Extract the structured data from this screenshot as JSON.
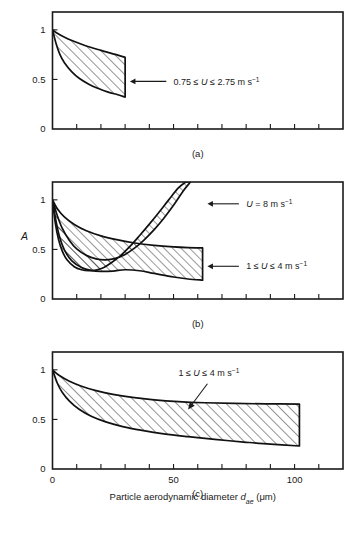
{
  "figure": {
    "xlabel_main": "Particle aerodynamic diameter ",
    "xlabel_sym": "d",
    "xlabel_sub": "ae",
    "xlabel_unit": " (μm)",
    "ylabel": "A",
    "xticklabels": [
      "0",
      "50",
      "100"
    ],
    "yticklabels": [
      "0",
      "0.5",
      "1"
    ]
  },
  "chart_data": {
    "type": "area",
    "title": "",
    "xlabel": "Particle aerodynamic diameter d_ae (μm)",
    "ylabel": "A",
    "xlim": [
      0,
      120
    ],
    "ylim": [
      0,
      1.18
    ],
    "xticks": [
      0,
      10,
      20,
      30,
      40,
      50,
      60,
      70,
      80,
      90,
      100,
      110,
      120
    ],
    "xtick_labeled": [
      0,
      50,
      100
    ],
    "yticks": [
      0,
      0.5,
      1
    ],
    "grid": false,
    "legend": "none",
    "panels": [
      {
        "id": "a",
        "caption": "(a)",
        "bands": [
          {
            "name": "0.75 <= U <= 2.75 m/s",
            "label": "0.75 ≤ U ≤ 2.75 m s⁻¹",
            "label_parts": {
              "pre": "0.75 ≤ ",
              "sym": "U",
              "mid": " ≤ 2.75 m s",
              "sup": "−1"
            },
            "x_start": 0,
            "x_end": 30,
            "upper": [
              [
                0,
                1.0
              ],
              [
                2,
                0.965
              ],
              [
                5,
                0.925
              ],
              [
                8,
                0.892
              ],
              [
                12,
                0.855
              ],
              [
                16,
                0.822
              ],
              [
                20,
                0.793
              ],
              [
                24,
                0.765
              ],
              [
                27,
                0.745
              ],
              [
                30,
                0.722
              ]
            ],
            "lower": [
              [
                0,
                1.0
              ],
              [
                1.5,
                0.86
              ],
              [
                3,
                0.755
              ],
              [
                5,
                0.665
              ],
              [
                8,
                0.575
              ],
              [
                11,
                0.512
              ],
              [
                15,
                0.452
              ],
              [
                19,
                0.408
              ],
              [
                23,
                0.372
              ],
              [
                27,
                0.345
              ],
              [
                30,
                0.322
              ]
            ],
            "annotation": {
              "arrow_from_x": 47,
              "arrow_to_x": 32,
              "arrow_y": 0.48,
              "text_x": 50,
              "text_y": 0.48
            }
          }
        ]
      },
      {
        "id": "b",
        "caption": "(b)",
        "bands": [
          {
            "name": "1 <= U <= 4 m/s",
            "label": "1 ≤ U ≤ 4 m s⁻¹",
            "label_parts": {
              "pre": "1 ≤ ",
              "sym": "U",
              "mid": " ≤ 4 m s",
              "sup": "−1"
            },
            "x_start": 0,
            "x_end": 62,
            "upper": [
              [
                0,
                1.0
              ],
              [
                2,
                0.91
              ],
              [
                5,
                0.825
              ],
              [
                9,
                0.752
              ],
              [
                14,
                0.688
              ],
              [
                20,
                0.637
              ],
              [
                27,
                0.596
              ],
              [
                34,
                0.565
              ],
              [
                42,
                0.541
              ],
              [
                50,
                0.525
              ],
              [
                56,
                0.518
              ],
              [
                62,
                0.515
              ]
            ],
            "lower": [
              [
                0,
                1.0
              ],
              [
                1.5,
                0.78
              ],
              [
                3,
                0.62
              ],
              [
                5,
                0.49
              ],
              [
                8,
                0.385
              ],
              [
                12,
                0.318
              ],
              [
                16,
                0.288
              ],
              [
                20,
                0.278
              ],
              [
                25,
                0.282
              ],
              [
                30,
                0.295
              ],
              [
                36,
                0.285
              ],
              [
                42,
                0.258
              ],
              [
                50,
                0.222
              ],
              [
                56,
                0.202
              ],
              [
                62,
                0.19
              ]
            ],
            "annotation": {
              "arrow_from_x": 77,
              "arrow_to_x": 64,
              "arrow_y": 0.33,
              "text_x": 80,
              "text_y": 0.33
            }
          },
          {
            "name": "U = 8 m/s",
            "label": "U = 8 m s⁻¹",
            "label_parts": {
              "pre": "",
              "sym": "U",
              "mid": " = 8 m s",
              "sup": "−1"
            },
            "x_start": 0,
            "x_end": 62,
            "upper": [
              [
                0,
                1.0
              ],
              [
                2,
                0.84
              ],
              [
                4,
                0.715
              ],
              [
                7,
                0.59
              ],
              [
                10,
                0.505
              ],
              [
                14,
                0.44
              ],
              [
                18,
                0.405
              ],
              [
                22,
                0.395
              ],
              [
                26,
                0.41
              ],
              [
                30,
                0.45
              ],
              [
                34,
                0.515
              ],
              [
                38,
                0.6
              ],
              [
                42,
                0.7
              ],
              [
                46,
                0.815
              ],
              [
                50,
                0.945
              ],
              [
                54,
                1.09
              ],
              [
                57,
                1.18
              ]
            ],
            "lower": [
              [
                0,
                1.0
              ],
              [
                1.2,
                0.76
              ],
              [
                2.5,
                0.6
              ],
              [
                4,
                0.485
              ],
              [
                6,
                0.395
              ],
              [
                9,
                0.325
              ],
              [
                12,
                0.295
              ],
              [
                15,
                0.285
              ],
              [
                18,
                0.292
              ],
              [
                21,
                0.315
              ],
              [
                24,
                0.36
              ],
              [
                28,
                0.435
              ],
              [
                32,
                0.53
              ],
              [
                36,
                0.64
              ],
              [
                40,
                0.755
              ],
              [
                44,
                0.875
              ],
              [
                48,
                1.0
              ],
              [
                52,
                1.12
              ],
              [
                55,
                1.18
              ]
            ],
            "annotation": {
              "arrow_from_x": 77,
              "arrow_to_x": 64,
              "arrow_y": 0.96,
              "text_x": 80,
              "text_y": 0.96
            }
          }
        ]
      },
      {
        "id": "c",
        "caption": "(c)",
        "bands": [
          {
            "name": "1 <= U <= 4 m/s",
            "label": "1 ≤ U ≤ 4 m s⁻¹",
            "label_parts": {
              "pre": "1 ≤ ",
              "sym": "U",
              "mid": " ≤ 4 m s",
              "sup": "−1"
            },
            "x_start": 0,
            "x_end": 102,
            "upper": [
              [
                0,
                1.0
              ],
              [
                3,
                0.94
              ],
              [
                7,
                0.885
              ],
              [
                12,
                0.835
              ],
              [
                18,
                0.79
              ],
              [
                25,
                0.752
              ],
              [
                33,
                0.722
              ],
              [
                42,
                0.698
              ],
              [
                52,
                0.68
              ],
              [
                63,
                0.668
              ],
              [
                75,
                0.661
              ],
              [
                88,
                0.657
              ],
              [
                102,
                0.655
              ]
            ],
            "lower": [
              [
                0,
                1.0
              ],
              [
                2,
                0.865
              ],
              [
                4,
                0.775
              ],
              [
                7,
                0.685
              ],
              [
                11,
                0.602
              ],
              [
                16,
                0.532
              ],
              [
                22,
                0.475
              ],
              [
                29,
                0.428
              ],
              [
                37,
                0.39
              ],
              [
                46,
                0.355
              ],
              [
                56,
                0.326
              ],
              [
                67,
                0.298
              ],
              [
                79,
                0.272
              ],
              [
                90,
                0.25
              ],
              [
                102,
                0.232
              ]
            ],
            "annotation": {
              "leader_from_x": 64,
              "leader_from_y": 0.86,
              "leader_to_x": 56,
              "leader_to_y": 0.6,
              "text_x": 52,
              "text_y": 0.94
            }
          }
        ]
      }
    ]
  }
}
